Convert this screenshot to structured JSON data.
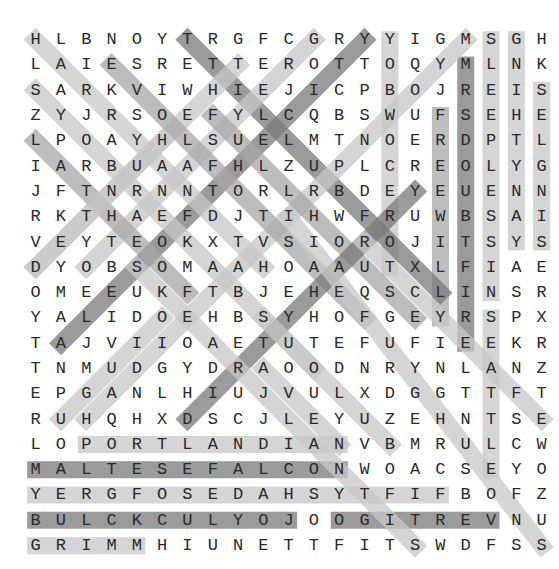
{
  "puzzle": {
    "type": "word-search",
    "rows": 21,
    "cols": 21,
    "grid": [
      "HLBNOYTRGFCGRYYIGMSGH",
      "LAIESRETTEROTTOQYMLNK",
      "SARKVIWHIEJICPBOJREIS",
      "ZYJRSOEFYLCQBSWUFSEHE",
      "LPOAYHLSUELMTNOERDPTL",
      "IARBUAAFHLZUPLCREOLYG",
      "JFTNRNNTORLRBDEYEUENN",
      "RKTHAEFDJTIHWFRUWBSAI",
      "VEYTEOKXTVSIOROJITSYS",
      "DYOBSOMAAHOAAUTXLFIAE",
      "OMEEUKFTBJEHEQSCLINSR",
      "YALIDOEHBSYHOFGEYRSPX",
      "TAJVIIOAETUTEFUFIEEKR",
      "TNMUDGYDRAOODNRYNLANZ",
      "EPGANLHIUJVULXDGGTTFT",
      "RUHQHXDSCJLEYUZEHNTSE",
      "LOPORTLANDIANVBMRULCW",
      "MALTESEFALCONWOACSEYO",
      "YERGFOSEDAHSYTFIFBOFZ",
      "BULCKCULYOJOOGITREVNU",
      "GRIMMHIUNETTFITSWDFSS"
    ],
    "colors": {
      "letter": "#2a2a2a",
      "highlight_light": "#c8c8c8",
      "highlight_medium": "#a8a8a8",
      "highlight_dark": "#7a7a7a"
    },
    "highlights": [
      {
        "from": [
          1,
          15
        ],
        "to": [
          10,
          15
        ],
        "shade": "light"
      },
      {
        "from": [
          4,
          17
        ],
        "to": [
          12,
          17
        ],
        "shade": "medium"
      },
      {
        "from": [
          2,
          18
        ],
        "to": [
          13,
          18
        ],
        "shade": "dark"
      },
      {
        "from": [
          1,
          19
        ],
        "to": [
          11,
          19
        ],
        "shade": "light"
      },
      {
        "from": [
          12,
          19
        ],
        "to": [
          18,
          19
        ],
        "shade": "light"
      },
      {
        "from": [
          1,
          20
        ],
        "to": [
          9,
          20
        ],
        "shade": "light"
      },
      {
        "from": [
          3,
          21
        ],
        "to": [
          9,
          21
        ],
        "shade": "light"
      },
      {
        "from": [
          17,
          3
        ],
        "to": [
          17,
          13
        ],
        "shade": "light"
      },
      {
        "from": [
          18,
          1
        ],
        "to": [
          18,
          13
        ],
        "shade": "dark"
      },
      {
        "from": [
          19,
          1
        ],
        "to": [
          19,
          17
        ],
        "shade": "light"
      },
      {
        "from": [
          20,
          1
        ],
        "to": [
          20,
          11
        ],
        "shade": "dark"
      },
      {
        "from": [
          20,
          13
        ],
        "to": [
          20,
          19
        ],
        "shade": "dark"
      },
      {
        "from": [
          21,
          1
        ],
        "to": [
          21,
          5
        ],
        "shade": "light"
      },
      {
        "from": [
          1,
          7
        ],
        "to": [
          11,
          17
        ],
        "shade": "dark"
      },
      {
        "from": [
          1,
          14
        ],
        "to": [
          13,
          2
        ],
        "shade": "dark"
      },
      {
        "from": [
          1,
          18
        ],
        "to": [
          16,
          3
        ],
        "shade": "light"
      },
      {
        "from": [
          1,
          12
        ],
        "to": [
          10,
          3
        ],
        "shade": "light"
      },
      {
        "from": [
          2,
          9
        ],
        "to": [
          10,
          1
        ],
        "shade": "light"
      },
      {
        "from": [
          2,
          4
        ],
        "to": [
          12,
          14
        ],
        "shade": "medium"
      },
      {
        "from": [
          1,
          1
        ],
        "to": [
          10,
          10
        ],
        "shade": "light"
      },
      {
        "from": [
          3,
          1
        ],
        "to": [
          14,
          12
        ],
        "shade": "light"
      },
      {
        "from": [
          4,
          8
        ],
        "to": [
          12,
          16
        ],
        "shade": "medium"
      },
      {
        "from": [
          5,
          1
        ],
        "to": [
          11,
          7
        ],
        "shade": "medium"
      },
      {
        "from": [
          7,
          16
        ],
        "to": [
          16,
          7
        ],
        "shade": "dark"
      },
      {
        "from": [
          10,
          1
        ],
        "to": [
          5,
          6
        ],
        "shade": "light"
      },
      {
        "from": [
          9,
          1
        ],
        "to": [
          14,
          1
        ],
        "shade": "none"
      },
      {
        "from": [
          10,
          5
        ],
        "to": [
          21,
          16
        ],
        "shade": "light"
      },
      {
        "from": [
          8,
          11
        ],
        "to": [
          21,
          21
        ],
        "shade": "light"
      },
      {
        "from": [
          9,
          14
        ],
        "to": [
          16,
          21
        ],
        "shade": "light"
      },
      {
        "from": [
          12,
          10
        ],
        "to": [
          17,
          15
        ],
        "shade": "light"
      },
      {
        "from": [
          14,
          10
        ],
        "to": [
          17,
          13
        ],
        "shade": "light"
      },
      {
        "from": [
          16,
          2
        ],
        "to": [
          12,
          6
        ],
        "shade": "light"
      }
    ]
  }
}
